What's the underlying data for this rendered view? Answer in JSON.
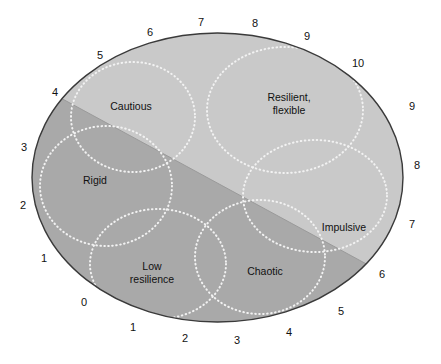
{
  "figure": {
    "shape": "ellipse",
    "ellipse": {
      "cx": 217.5,
      "cy": 177.5,
      "rx": 185.5,
      "ry": 144.5
    },
    "colors": {
      "light_region": "#c9c9c9",
      "dark_region": "#a9a9a9",
      "outline": "#3a3a3a",
      "dotted_circle": "#f2f2f2",
      "text": "#111111",
      "background": "#ffffff"
    },
    "divider": {
      "x1": 57,
      "y1": 96,
      "x2": 383,
      "y2": 273
    }
  },
  "regions": [
    {
      "id": "cautious",
      "label": "Cautious",
      "x": 131,
      "y": 106,
      "lines": [
        "Cautious"
      ]
    },
    {
      "id": "resilient",
      "label": "Resilient, flexible",
      "x": 289,
      "y": 103,
      "lines": [
        "Resilient,",
        "flexible"
      ]
    },
    {
      "id": "rigid",
      "label": "Rigid",
      "x": 95,
      "y": 180,
      "lines": [
        "Rigid"
      ]
    },
    {
      "id": "impulsive",
      "label": "Impulsive",
      "x": 344,
      "y": 227,
      "lines": [
        "Impulsive"
      ]
    },
    {
      "id": "low-resilience",
      "label": "Low resilience",
      "x": 152,
      "y": 272,
      "lines": [
        "Low",
        "resilience"
      ]
    },
    {
      "id": "chaotic",
      "label": "Chaotic",
      "x": 265,
      "y": 271,
      "lines": [
        "Chaotic"
      ]
    }
  ],
  "dotted_circles": [
    {
      "id": "circle-cautious",
      "cx": 133,
      "cy": 117,
      "rx": 62,
      "ry": 55
    },
    {
      "id": "circle-resilient",
      "cx": 285,
      "cy": 110,
      "rx": 78,
      "ry": 63
    },
    {
      "id": "circle-rigid",
      "cx": 106,
      "cy": 186,
      "rx": 66,
      "ry": 60
    },
    {
      "id": "circle-impulsive",
      "cx": 315,
      "cy": 196,
      "rx": 72,
      "ry": 56
    },
    {
      "id": "circle-low-resilience",
      "cx": 158,
      "cy": 264,
      "rx": 68,
      "ry": 55
    },
    {
      "id": "circle-chaotic",
      "cx": 260,
      "cy": 257,
      "rx": 65,
      "ry": 57
    }
  ],
  "axis_labels": [
    {
      "text": "4",
      "x": 55,
      "y": 92,
      "axis": "upper-left"
    },
    {
      "text": "5",
      "x": 100,
      "y": 55,
      "axis": "upper-left"
    },
    {
      "text": "6",
      "x": 150,
      "y": 32,
      "axis": "upper-left"
    },
    {
      "text": "7",
      "x": 201,
      "y": 22,
      "axis": "upper-left"
    },
    {
      "text": "8",
      "x": 255,
      "y": 23,
      "axis": "upper-left"
    },
    {
      "text": "9",
      "x": 307,
      "y": 36,
      "axis": "upper-left"
    },
    {
      "text": "10",
      "x": 358,
      "y": 63,
      "axis": "upper-left"
    },
    {
      "text": "9",
      "x": 412,
      "y": 106,
      "axis": "right"
    },
    {
      "text": "8",
      "x": 417,
      "y": 165,
      "axis": "right"
    },
    {
      "text": "7",
      "x": 412,
      "y": 224,
      "axis": "right"
    },
    {
      "text": "6",
      "x": 382,
      "y": 274,
      "axis": "right"
    },
    {
      "text": "5",
      "x": 341,
      "y": 311,
      "axis": "right"
    },
    {
      "text": "4",
      "x": 289,
      "y": 332,
      "axis": "right"
    },
    {
      "text": "3",
      "x": 237,
      "y": 340,
      "axis": "right"
    },
    {
      "text": "2",
      "x": 185,
      "y": 338,
      "axis": "right"
    },
    {
      "text": "1",
      "x": 133,
      "y": 327,
      "axis": "right"
    },
    {
      "text": "0",
      "x": 84,
      "y": 302,
      "axis": "right"
    },
    {
      "text": "1",
      "x": 44,
      "y": 258,
      "axis": "left"
    },
    {
      "text": "2",
      "x": 23,
      "y": 205,
      "axis": "left"
    },
    {
      "text": "3",
      "x": 24,
      "y": 147,
      "axis": "left"
    }
  ]
}
